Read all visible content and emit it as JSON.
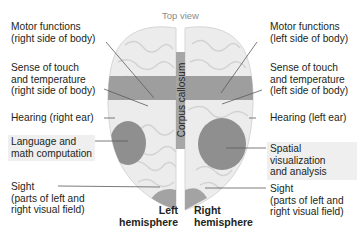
{
  "title": "Top view",
  "corpus_callosum": "Corpus callosum",
  "left_labels": [
    {
      "lines": [
        "Motor functions",
        "(right side of body)"
      ]
    },
    {
      "lines": [
        "Sense of touch",
        "and temperature",
        "(right side of body)"
      ]
    },
    {
      "lines": [
        "Hearing (right ear)"
      ]
    },
    {
      "lines": [
        "Language and",
        "math computation"
      ]
    },
    {
      "lines": [
        "Sight",
        "(parts of left and",
        "right visual field)"
      ]
    }
  ],
  "right_labels": [
    {
      "lines": [
        "Motor functions",
        "(left side of body)"
      ]
    },
    {
      "lines": [
        "Sense of touch",
        "and temperature",
        "(left side of body)"
      ]
    },
    {
      "lines": [
        "Hearing (left ear)"
      ]
    },
    {
      "lines": [
        "Spatial",
        "visualization",
        "and analysis"
      ]
    },
    {
      "lines": [
        "Sight",
        "(parts of left and",
        "right visual field)"
      ]
    }
  ],
  "hemispheres": {
    "left": [
      "Left",
      "hemisphere"
    ],
    "right": [
      "Right",
      "hemisphere"
    ]
  },
  "colors": {
    "brain": "#ebebeb",
    "brain_fold": "#cfcfcf",
    "band": "#9d9d9d",
    "region": "#8f8f8f",
    "label_highlight": "#efefef",
    "leader_line": "#555555",
    "title_text": "#8c8c8c"
  }
}
